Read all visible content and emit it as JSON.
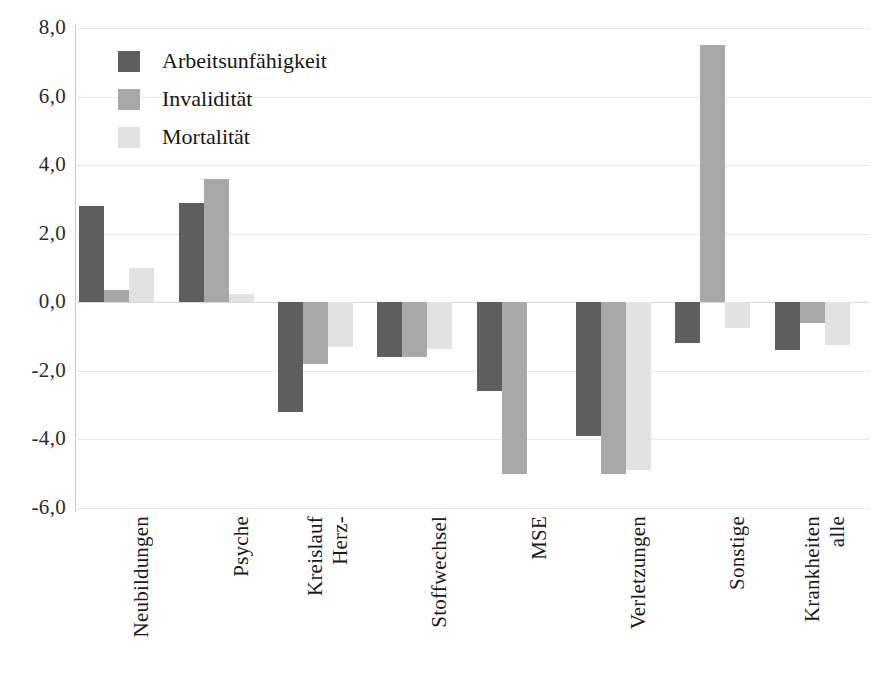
{
  "chart_data": {
    "type": "bar",
    "title": "",
    "subtitle": "",
    "xlabel": "",
    "ylabel": "",
    "ylim": [
      -6.0,
      8.0
    ],
    "ytick_values": [
      8.0,
      6.0,
      4.0,
      2.0,
      0.0,
      -2.0,
      -4.0,
      -6.0
    ],
    "ytick_labels": [
      "8,0",
      "6,0",
      "4,0",
      "2,0",
      "0,0",
      "-2,0",
      "-4,0",
      "-6,0"
    ],
    "grid": true,
    "legend_position": "top-left",
    "decimal_separator": ",",
    "categories": [
      "Neubildungen",
      "Psyche",
      "Herz-\nKreislauf",
      "Stoffwechsel",
      "MSE",
      "Verletzungen",
      "Sonstige",
      "alle\nKrankheiten"
    ],
    "category_lines": [
      [
        "Neubildungen"
      ],
      [
        "Psyche"
      ],
      [
        "Herz-",
        "Kreislauf"
      ],
      [
        "Stoffwechsel"
      ],
      [
        "MSE"
      ],
      [
        "Verletzungen"
      ],
      [
        "Sonstige"
      ],
      [
        "alle",
        "Krankheiten"
      ]
    ],
    "series": [
      {
        "name": "Arbeitsunfähigkeit",
        "color": "#5e5e5e",
        "values": [
          2.8,
          2.9,
          -3.2,
          -1.6,
          -2.6,
          -3.9,
          -1.2,
          -1.4
        ]
      },
      {
        "name": "Invalidität",
        "color": "#a8a8a8",
        "values": [
          0.35,
          3.6,
          -1.8,
          -1.6,
          -5.0,
          -5.0,
          7.5,
          -0.6
        ]
      },
      {
        "name": "Mortalität",
        "color": "#e2e2e2",
        "values": [
          1.0,
          0.25,
          -1.3,
          -1.35,
          0.0,
          -4.9,
          -0.75,
          -1.25
        ]
      }
    ]
  },
  "legend": {
    "items": [
      {
        "label": "Arbeitsunfähigkeit",
        "swatch": "legend-swatch-dark"
      },
      {
        "label": "Invalidität",
        "swatch": "legend-swatch-medium"
      },
      {
        "label": "Mortalität",
        "swatch": "legend-swatch-light"
      }
    ]
  },
  "colors": {
    "series_dark": "#5e5e5e",
    "series_medium": "#a8a8a8",
    "series_light": "#e2e2e2",
    "gridline": "#e9e9e9",
    "axis": "#c8c8c8",
    "text": "#1a1a1a",
    "background": "#ffffff"
  }
}
